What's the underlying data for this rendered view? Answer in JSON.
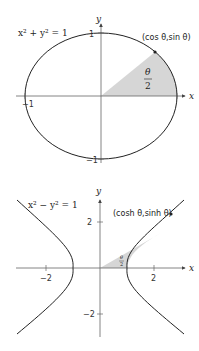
{
  "figures": [
    {
      "id": "circle",
      "equation": "x² + y² = 1",
      "point_label": "(cos θ,sin θ)",
      "area_label_num": "θ",
      "area_label_den": "2",
      "axis_x": "x",
      "axis_y": "y",
      "ticks": {
        "top": "1",
        "bottom": "−1",
        "left": "−1",
        "right": "1"
      }
    },
    {
      "id": "hyperbola",
      "equation": "x² − y² = 1",
      "point_label": "(cosh θ,sinh θ)",
      "area_label_num": "θ",
      "area_label_den": "2",
      "axis_x": "x",
      "axis_y": "y",
      "ticks": {
        "x_neg": "−2",
        "x_pos": "2",
        "y_pos": "2",
        "y_neg": "−2"
      }
    }
  ],
  "colors": {
    "curve": "#222222",
    "axis": "#555555",
    "shade": "#d6d6d6"
  }
}
